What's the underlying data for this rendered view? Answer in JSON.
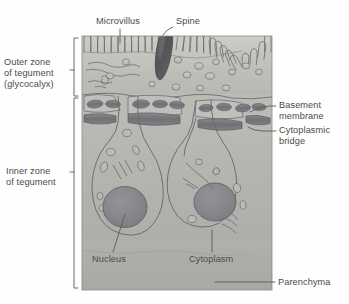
{
  "figure": {
    "kind": "biological-diagram",
    "frame": {
      "x": 82,
      "y": 36,
      "w": 190,
      "h": 254
    }
  },
  "labels": {
    "microvillus": "Microvillus",
    "spine": "Spine",
    "outer_zone_line1": "Outer zone",
    "outer_zone_line2": "of tegument",
    "outer_zone_line3": "(glycocalyx)",
    "inner_zone_line1": "Inner zone",
    "inner_zone_line2": "of tegument",
    "basement_line1": "Basement",
    "basement_line2": "membrane",
    "bridge_line1": "Cytoplasmic",
    "bridge_line2": "bridge",
    "nucleus": "Nucleus",
    "cytoplasm": "Cytoplasm",
    "parenchyma": "Parenchyma"
  },
  "colors": {
    "text": "#4a4a4a",
    "leader": "#5a5a5a",
    "outline": "#6e6e6e",
    "tegument_outer": "#c9c9c4",
    "tegument_inner": "#b9b9b4",
    "parenchyma": "#b4b4ae",
    "spine": "#565659",
    "nucleus": "#828287",
    "membrane_bar": "#77777c",
    "vesicle_fill": "#c4c4bf",
    "page_bg": "#fefefe"
  },
  "structures": {
    "microvilli_count": 34,
    "cell_bodies": 2,
    "nuclei": 2,
    "basement_membrane_bars": 9,
    "vesicles": 22
  }
}
